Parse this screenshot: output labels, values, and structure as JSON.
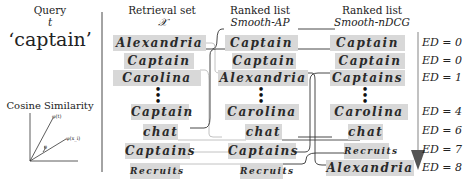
{
  "query": {
    "label": "Query",
    "symbol": "t",
    "word": "‘captain’"
  },
  "cosine": {
    "title": "Cosine Similarity",
    "vec1": "φ(t)",
    "vec2": "φ(x_i)",
    "angle": "θ"
  },
  "columns": {
    "retrieval": {
      "title": "Retrieval set",
      "subtitle": "𝒳"
    },
    "smooth_ap": {
      "title": "Ranked list",
      "subtitle": "Smooth-AP"
    },
    "smooth_ndcg": {
      "title": "Ranked list",
      "subtitle": "Smooth-nDCG"
    }
  },
  "retrieval_set": [
    "Alexandria",
    "Captain",
    "Carolina",
    "Captain",
    "chat",
    "Captains",
    "Recruits"
  ],
  "smooth_ap_list": [
    "Captain",
    "Captain",
    "Alexandria",
    "Carolina",
    "chat",
    "Captains",
    "Recruits"
  ],
  "smooth_ndcg_list": [
    "Captain",
    "Captain",
    "Captains",
    "Carolina",
    "chat",
    "Recruits",
    "Alexandria"
  ],
  "edit_distances": [
    "ED = 0",
    "ED = 0",
    "ED = 1",
    "ED = 4",
    "ED = 6",
    "ED = 7",
    "ED = 8"
  ],
  "dots": "•\n•\n•"
}
